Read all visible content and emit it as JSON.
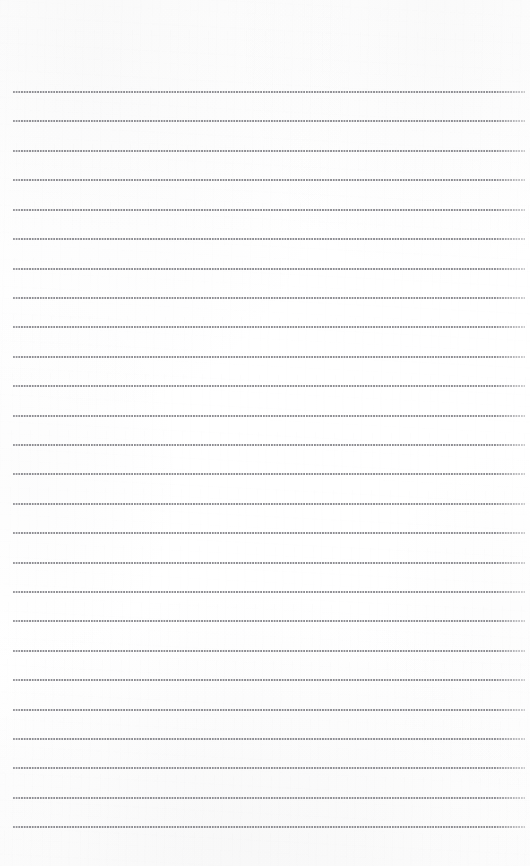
{
  "document": {
    "type": "lined-notebook-page",
    "title": "Blank lined notepad page",
    "content_text": "",
    "page_width": 530,
    "page_height": 866,
    "background_color": "#fefefe",
    "has_visible_text": false,
    "has_handwriting": false
  },
  "rules": {
    "style": "dotted",
    "count": 26,
    "first_line_y": 91,
    "line_spacing": 29.4,
    "line_start_x": 13,
    "line_end_x": 525,
    "line_thickness": 2,
    "dot_color": "#8d8d92",
    "dot_pitch": 2.7,
    "positions_y": [
      91,
      120,
      150,
      179,
      209,
      238,
      268,
      297,
      326,
      356,
      385,
      415,
      444,
      473,
      503,
      532,
      562,
      591,
      620,
      650,
      679,
      709,
      738,
      767,
      797,
      826
    ]
  },
  "margins": {
    "top_margin_height": 91,
    "bottom_margin_height": 40,
    "left_margin_width": 13,
    "right_margin_width": 5
  },
  "texture": {
    "grain_opacity": 0.55,
    "corner_tint_color": "#8c8c92",
    "paper_tone": "#fdfdfd"
  }
}
